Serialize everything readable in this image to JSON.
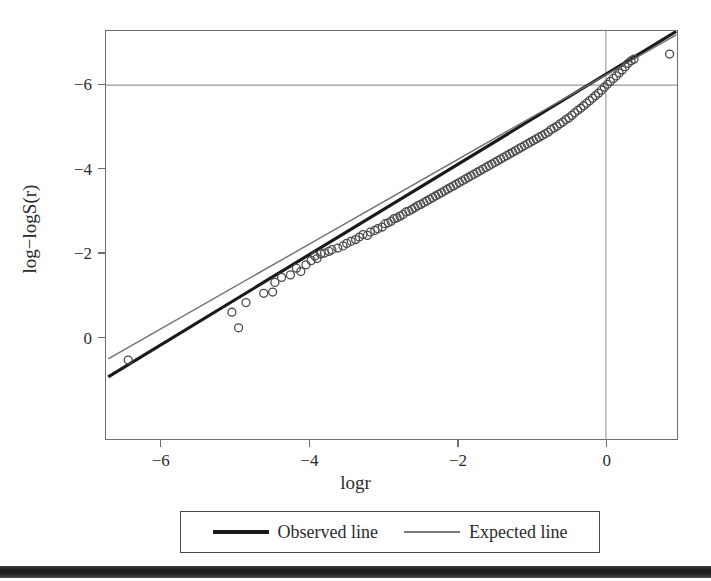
{
  "figure": {
    "background_color": "#ffffff",
    "frame_color": "#6f6f6f",
    "artifact_bar_color": "#1c1c1c"
  },
  "axis": {
    "x_title": "logr",
    "y_title": "log−logS(r)",
    "x_ticks": [
      "−6",
      "−4",
      "−2",
      "0"
    ],
    "y_ticks": [
      "0",
      "−2",
      "−4",
      "−6"
    ]
  },
  "legend": {
    "entries": [
      {
        "label": "Observed line",
        "style": "thick-solid",
        "color": "#1a1a1a"
      },
      {
        "label": "Expected line",
        "style": "thin-solid",
        "color": "#7d7d7d"
      }
    ]
  },
  "chart_data": {
    "type": "scatter",
    "title": "",
    "subtitle": "",
    "xlabel": "logr",
    "ylabel": "log−logS(r)",
    "xlim": [
      -6.75,
      0.96
    ],
    "ylim": [
      -8.43,
      1.29
    ],
    "xticks": [
      -6,
      -4,
      -2,
      0
    ],
    "yticks": [
      -6,
      -4,
      -2,
      0
    ],
    "grid": false,
    "reference_lines": [
      {
        "name": "vertical-zero",
        "orientation": "vertical",
        "value": 0,
        "color": "#9a9a9a",
        "width": 1.1
      },
      {
        "name": "horizontal-zero",
        "orientation": "horizontal",
        "value": 0,
        "color": "#9a9a9a",
        "width": 1.1
      }
    ],
    "legend_position": "below-axis",
    "marker": {
      "shape": "open-circle",
      "radius": 4.0,
      "color": "#4a4a4a",
      "width": 1.3
    },
    "series": [
      {
        "name": "Observed line",
        "type": "line",
        "color": "#1a1a1a",
        "width": 3.2,
        "endpoints": [
          [
            -6.72,
            -6.95
          ],
          [
            0.95,
            1.28
          ]
        ]
      },
      {
        "name": "Expected line",
        "type": "line",
        "color": "#6f6f6f",
        "width": 1.4,
        "endpoints": [
          [
            -6.72,
            -6.52
          ],
          [
            0.95,
            1.2
          ]
        ]
      }
    ],
    "points": [
      [
        -6.45,
        -6.55
      ],
      [
        -5.05,
        -5.41
      ],
      [
        -4.96,
        -5.78
      ],
      [
        -4.86,
        -5.18
      ],
      [
        -4.62,
        -4.96
      ],
      [
        -4.5,
        -4.93
      ],
      [
        -4.47,
        -4.7
      ],
      [
        -4.38,
        -4.58
      ],
      [
        -4.26,
        -4.52
      ],
      [
        -4.18,
        -4.36
      ],
      [
        -4.12,
        -4.44
      ],
      [
        -4.05,
        -4.28
      ],
      [
        -3.98,
        -4.18
      ],
      [
        -3.93,
        -4.07
      ],
      [
        -3.9,
        -4.13
      ],
      [
        -3.85,
        -4.02
      ],
      [
        -3.8,
        -4.0
      ],
      [
        -3.74,
        -3.96
      ],
      [
        -3.7,
        -3.92
      ],
      [
        -3.62,
        -3.88
      ],
      [
        -3.55,
        -3.83
      ],
      [
        -3.5,
        -3.77
      ],
      [
        -3.44,
        -3.72
      ],
      [
        -3.38,
        -3.68
      ],
      [
        -3.33,
        -3.62
      ],
      [
        -3.28,
        -3.56
      ],
      [
        -3.22,
        -3.58
      ],
      [
        -3.18,
        -3.5
      ],
      [
        -3.12,
        -3.46
      ],
      [
        -3.08,
        -3.42
      ],
      [
        -3.02,
        -3.38
      ],
      [
        -2.98,
        -3.3
      ],
      [
        -2.94,
        -3.28
      ],
      [
        -2.9,
        -3.24
      ],
      [
        -2.86,
        -3.18
      ],
      [
        -2.82,
        -3.16
      ],
      [
        -2.78,
        -3.12
      ],
      [
        -2.74,
        -3.08
      ],
      [
        -2.7,
        -3.02
      ],
      [
        -2.66,
        -3.0
      ],
      [
        -2.62,
        -2.96
      ],
      [
        -2.58,
        -2.92
      ],
      [
        -2.54,
        -2.87
      ],
      [
        -2.5,
        -2.84
      ],
      [
        -2.46,
        -2.8
      ],
      [
        -2.42,
        -2.76
      ],
      [
        -2.38,
        -2.72
      ],
      [
        -2.34,
        -2.68
      ],
      [
        -2.3,
        -2.64
      ],
      [
        -2.26,
        -2.6
      ],
      [
        -2.22,
        -2.56
      ],
      [
        -2.18,
        -2.52
      ],
      [
        -2.14,
        -2.48
      ],
      [
        -2.1,
        -2.44
      ],
      [
        -2.06,
        -2.4
      ],
      [
        -2.02,
        -2.36
      ],
      [
        -1.98,
        -2.32
      ],
      [
        -1.94,
        -2.28
      ],
      [
        -1.9,
        -2.24
      ],
      [
        -1.86,
        -2.2
      ],
      [
        -1.82,
        -2.16
      ],
      [
        -1.78,
        -2.12
      ],
      [
        -1.74,
        -2.08
      ],
      [
        -1.7,
        -2.04
      ],
      [
        -1.66,
        -2.0
      ],
      [
        -1.62,
        -1.96
      ],
      [
        -1.58,
        -1.92
      ],
      [
        -1.54,
        -1.88
      ],
      [
        -1.5,
        -1.84
      ],
      [
        -1.46,
        -1.8
      ],
      [
        -1.42,
        -1.76
      ],
      [
        -1.38,
        -1.72
      ],
      [
        -1.34,
        -1.68
      ],
      [
        -1.3,
        -1.64
      ],
      [
        -1.26,
        -1.6
      ],
      [
        -1.22,
        -1.56
      ],
      [
        -1.18,
        -1.52
      ],
      [
        -1.14,
        -1.48
      ],
      [
        -1.1,
        -1.44
      ],
      [
        -1.06,
        -1.4
      ],
      [
        -1.02,
        -1.36
      ],
      [
        -0.98,
        -1.32
      ],
      [
        -0.94,
        -1.28
      ],
      [
        -0.9,
        -1.24
      ],
      [
        -0.86,
        -1.2
      ],
      [
        -0.82,
        -1.16
      ],
      [
        -0.78,
        -1.12
      ],
      [
        -0.74,
        -1.06
      ],
      [
        -0.7,
        -1.02
      ],
      [
        -0.66,
        -0.98
      ],
      [
        -0.62,
        -0.92
      ],
      [
        -0.58,
        -0.88
      ],
      [
        -0.54,
        -0.82
      ],
      [
        -0.5,
        -0.78
      ],
      [
        -0.46,
        -0.72
      ],
      [
        -0.42,
        -0.66
      ],
      [
        -0.38,
        -0.6
      ],
      [
        -0.34,
        -0.55
      ],
      [
        -0.3,
        -0.49
      ],
      [
        -0.26,
        -0.43
      ],
      [
        -0.22,
        -0.37
      ],
      [
        -0.18,
        -0.31
      ],
      [
        -0.14,
        -0.25
      ],
      [
        -0.1,
        -0.19
      ],
      [
        -0.06,
        -0.12
      ],
      [
        -0.02,
        -0.05
      ],
      [
        0.02,
        0.02
      ],
      [
        0.06,
        0.09
      ],
      [
        0.1,
        0.16
      ],
      [
        0.14,
        0.22
      ],
      [
        0.18,
        0.29
      ],
      [
        0.22,
        0.36
      ],
      [
        0.26,
        0.44
      ],
      [
        0.3,
        0.52
      ],
      [
        0.34,
        0.58
      ],
      [
        0.38,
        0.62
      ],
      [
        0.86,
        0.74
      ]
    ]
  }
}
